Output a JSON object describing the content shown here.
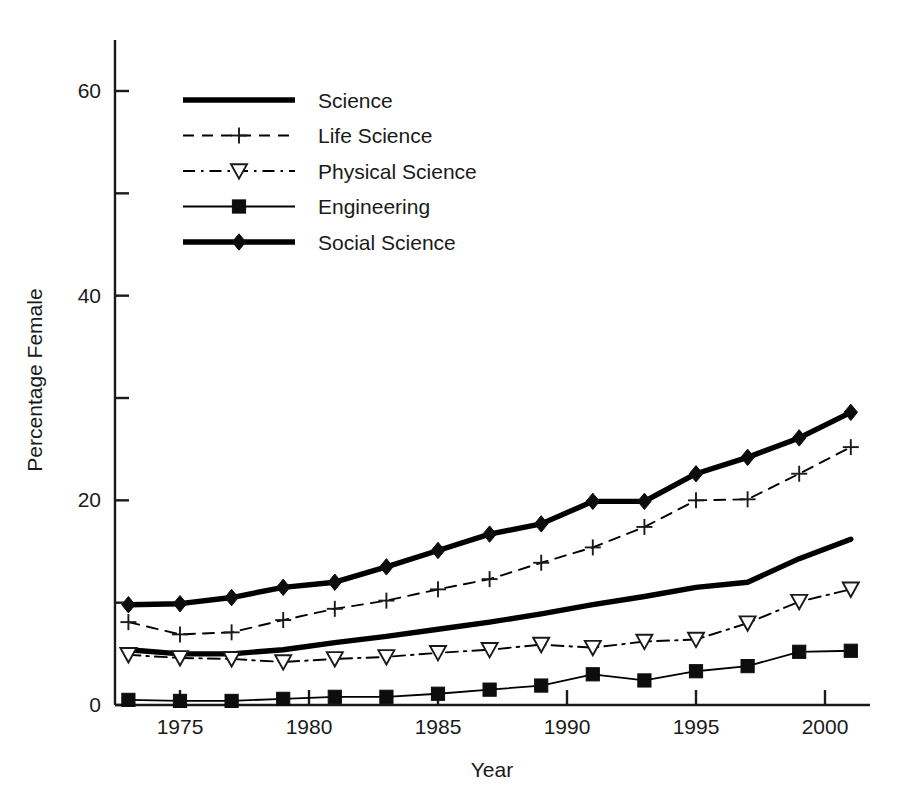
{
  "chart_data": {
    "type": "line",
    "title": "",
    "xlabel": "Year",
    "ylabel": "Percentage Female",
    "xlim": [
      1972,
      2002
    ],
    "ylim": [
      0,
      66
    ],
    "xticks": [
      1975,
      1980,
      1985,
      1990,
      1995,
      2000
    ],
    "xtick_labels": [
      "1975",
      "1980",
      "1985",
      "1990",
      "1995",
      "2000"
    ],
    "yticks": [
      0,
      20,
      40,
      60
    ],
    "ytick_labels": [
      "0",
      "20",
      "40",
      "60"
    ],
    "yminorticks": [
      10,
      30,
      50
    ],
    "grid": false,
    "legend_position": "upper left",
    "x": [
      1973,
      1975,
      1977,
      1979,
      1981,
      1983,
      1985,
      1987,
      1989,
      1991,
      1993,
      1995,
      1997,
      1999,
      2001
    ],
    "series": [
      {
        "name": "Science",
        "style": "thick-solid",
        "marker": "none",
        "color": "#000000",
        "values": [
          5.4,
          5.0,
          5.0,
          5.4,
          6.1,
          6.7,
          7.4,
          8.1,
          8.9,
          9.8,
          10.6,
          11.5,
          12.0,
          14.3,
          16.2
        ]
      },
      {
        "name": "Life Science",
        "style": "dashed",
        "marker": "plus",
        "color": "#000000",
        "values": [
          8.1,
          6.9,
          7.1,
          8.3,
          9.4,
          10.2,
          11.3,
          12.3,
          13.9,
          15.4,
          17.4,
          20.0,
          20.1,
          22.6,
          25.2
        ]
      },
      {
        "name": "Physical Science",
        "style": "dashdot",
        "marker": "triangle-down",
        "color": "#000000",
        "values": [
          4.9,
          4.6,
          4.5,
          4.2,
          4.5,
          4.7,
          5.1,
          5.4,
          5.9,
          5.6,
          6.2,
          6.4,
          8.0,
          10.1,
          11.3
        ]
      },
      {
        "name": "Engineering",
        "style": "thin-solid",
        "marker": "square",
        "color": "#000000",
        "values": [
          0.5,
          0.4,
          0.4,
          0.6,
          0.8,
          0.8,
          1.1,
          1.5,
          1.9,
          3.0,
          2.4,
          3.3,
          3.8,
          5.2,
          5.3
        ]
      },
      {
        "name": "Social Science",
        "style": "thick-solid",
        "marker": "diamond",
        "color": "#000000",
        "values": [
          9.8,
          9.9,
          10.5,
          11.5,
          12.0,
          13.5,
          15.1,
          16.7,
          17.7,
          19.9,
          19.9,
          22.6,
          24.2,
          26.1,
          28.6
        ]
      }
    ]
  },
  "legend": {
    "entries": [
      {
        "label": "Science"
      },
      {
        "label": "Life Science"
      },
      {
        "label": "Physical Science"
      },
      {
        "label": "Engineering"
      },
      {
        "label": "Social Science"
      }
    ]
  }
}
